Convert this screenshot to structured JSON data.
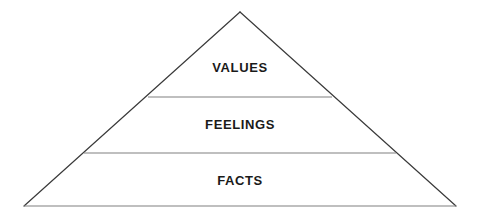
{
  "diagram": {
    "type": "pyramid",
    "title": "",
    "background_color": "#ffffff",
    "outline_color": "#3a3a3a",
    "divider_color": "#808080",
    "base_line_color": "#808080",
    "label_color": "#1a1a1a",
    "geometry": {
      "apex": {
        "x": 240,
        "y": 12
      },
      "base_left": {
        "x": 24,
        "y": 206
      },
      "base_right": {
        "x": 456,
        "y": 206
      },
      "dividers": [
        {
          "y": 97,
          "x_start": 148,
          "x_end": 332
        },
        {
          "y": 153,
          "x_start": 84,
          "x_end": 396
        }
      ]
    },
    "tiers": [
      {
        "id": "values",
        "label": "VALUES",
        "level": 1,
        "position": "top"
      },
      {
        "id": "feelings",
        "label": "FEELINGS",
        "level": 2,
        "position": "middle"
      },
      {
        "id": "facts",
        "label": "FACTS",
        "level": 3,
        "position": "bottom"
      }
    ]
  }
}
